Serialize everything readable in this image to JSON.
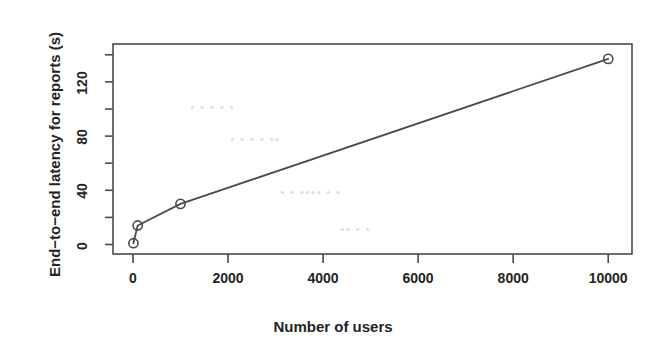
{
  "chart_data": {
    "type": "line",
    "title": "",
    "subtitle": "",
    "xlabel": "Number of users",
    "ylabel": "End−to−end latency for reports (s)",
    "x": [
      10,
      100,
      1000,
      10000
    ],
    "values": [
      1,
      14,
      30,
      137
    ],
    "series": [
      {
        "name": "End-to-end latency for reports",
        "x": [
          10,
          100,
          1000,
          10000
        ],
        "values": [
          1,
          14,
          30,
          137
        ]
      }
    ],
    "point_marker": "open-circle",
    "line_style": "solid",
    "grid": false,
    "legend": null,
    "xlim": [
      -420,
      10500
    ],
    "ylim": [
      -7,
      148
    ],
    "xticks": [
      0,
      2000,
      4000,
      6000,
      8000,
      10000
    ],
    "xtick_labels": [
      "0",
      "2000",
      "4000",
      "6000",
      "8000",
      "10000"
    ],
    "yticks": [
      0,
      40,
      80,
      120
    ],
    "ytick_labels": [
      "0",
      "40",
      "80",
      "120"
    ],
    "yticks_minor": [
      20,
      60,
      100,
      140
    ],
    "axis_color": "#4a4a4a",
    "line_color": "#4a4a4a",
    "marker_color": "#4a4a4a",
    "background": "#ffffff"
  },
  "figure": {
    "xlabel": "Number of users",
    "ylabel": "End−to−end latency for reports (s)",
    "xtick_labels": [
      "0",
      "2000",
      "4000",
      "6000",
      "8000",
      "10000"
    ],
    "ytick_labels": [
      "0",
      "40",
      "80",
      "120"
    ]
  },
  "artifacts": {
    "ghost_text": [
      "• • •  • •",
      "•  • •   • ••",
      "• •   •••• • •",
      "••  • •"
    ]
  }
}
